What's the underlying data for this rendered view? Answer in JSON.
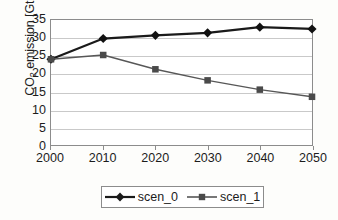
{
  "chart_data": {
    "type": "line",
    "title": "",
    "xlabel": "",
    "ylabel": "CO2 emission [GtC]",
    "ylabel_main": "CO",
    "ylabel_sub": "2",
    "ylabel_rest": " emission [GtC]",
    "x": [
      2000,
      2010,
      2020,
      2030,
      2040,
      2050
    ],
    "categories": [
      "2000",
      "2010",
      "2020",
      "2030",
      "2040",
      "2050"
    ],
    "xlim": [
      2000,
      2050
    ],
    "ylim": [
      0,
      35
    ],
    "yticks": [
      35,
      30,
      25,
      20,
      15,
      10,
      5,
      0
    ],
    "ytick_labels": [
      "35",
      "30",
      "25",
      "20",
      "15",
      "10",
      "5",
      "0"
    ],
    "grid": "horizontal",
    "legend_position": "bottom",
    "series": [
      {
        "name": "scen_0",
        "values": [
          24.0,
          29.8,
          30.7,
          31.4,
          33.0,
          32.5
        ],
        "color": "#1a1a1a",
        "marker": "diamond",
        "line_width": 2.2
      },
      {
        "name": "scen_1",
        "values": [
          24.0,
          25.2,
          21.2,
          18.1,
          15.5,
          13.5
        ],
        "color": "#575757",
        "marker": "square",
        "line_width": 1.4
      }
    ]
  },
  "legend": {
    "entries": [
      {
        "label": "scen_0"
      },
      {
        "label": "scen_1"
      }
    ]
  }
}
